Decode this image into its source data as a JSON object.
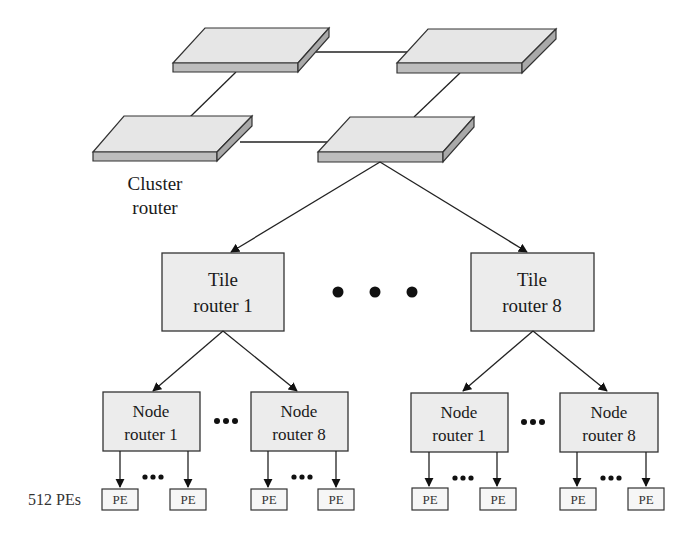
{
  "colors": {
    "stroke": "#222222",
    "box_fill": "#ececec",
    "platform_top": "#e6e6e6",
    "platform_side": "#a9a9a9",
    "platform_front": "#bdbdbd",
    "pe_fill": "#f6f6f6"
  },
  "cluster": {
    "label_line1": "Cluster",
    "label_line2": "router",
    "platforms": [
      {
        "id": "cluster-router-top-left"
      },
      {
        "id": "cluster-router-top-right"
      },
      {
        "id": "cluster-router-bottom-left"
      },
      {
        "id": "cluster-router-bottom-right"
      }
    ]
  },
  "tile_routers": [
    {
      "line1": "Tile",
      "line2": "router 1"
    },
    {
      "line1": "Tile",
      "line2": "router 8"
    }
  ],
  "tile_ellipsis": "• • •",
  "node_routers": [
    {
      "line1": "Node",
      "line2": "router 1"
    },
    {
      "line1": "Node",
      "line2": "router 8"
    },
    {
      "line1": "Node",
      "line2": "router 1"
    },
    {
      "line1": "Node",
      "line2": "router 8"
    }
  ],
  "node_ellipsis": "•••",
  "pe_ellipsis": "•••",
  "pe_label": "PE",
  "pe_count_label": "512 PEs"
}
